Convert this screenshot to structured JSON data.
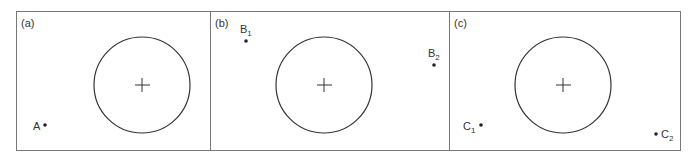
{
  "panels": [
    {
      "id": "a",
      "label": "(a)",
      "points": [
        {
          "name": "A",
          "sub": ""
        }
      ]
    },
    {
      "id": "b",
      "label": "(b)",
      "points": [
        {
          "name": "B",
          "sub": "1"
        },
        {
          "name": "B",
          "sub": "2"
        }
      ]
    },
    {
      "id": "c",
      "label": "(c)",
      "points": [
        {
          "name": "C",
          "sub": "1"
        },
        {
          "name": "C",
          "sub": "2"
        }
      ]
    }
  ],
  "colors": {
    "stroke": "#333333",
    "frame": "#777777"
  }
}
